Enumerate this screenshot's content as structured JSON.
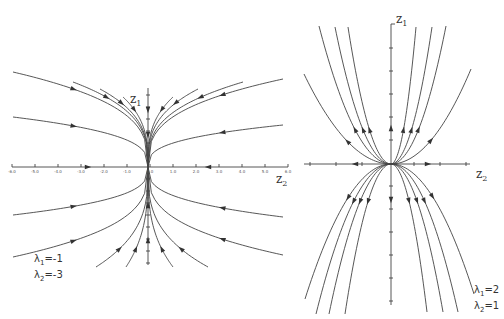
{
  "figure": {
    "panels": [
      {
        "id": "left",
        "type": "stable-node",
        "axes": {
          "horizontal_label": "z",
          "horizontal_sub": "2",
          "vertical_label": "z",
          "vertical_sub": "1",
          "tick_labels": [
            "-6.0",
            "-5.0",
            "-4.0",
            "-3.0",
            "-2.0",
            "-1.0",
            "0.0",
            "1.0",
            "2.0",
            "3.0",
            "4.0",
            "5.0",
            "6.0"
          ]
        },
        "eigenvalues": {
          "l1_symbol": "λ",
          "l1_sub": "1",
          "l1_value": "=-1",
          "l2_symbol": "λ",
          "l2_sub": "2",
          "l2_value": "=-3"
        }
      },
      {
        "id": "right",
        "type": "unstable-node",
        "axes": {
          "horizontal_label": "z",
          "horizontal_sub": "2",
          "vertical_label": "z",
          "vertical_sub": "1"
        },
        "eigenvalues": {
          "l1_symbol": "λ",
          "l1_sub": "1",
          "l1_value": "=2",
          "l2_symbol": "λ",
          "l2_sub": "2",
          "l2_value": "=1"
        }
      }
    ]
  },
  "chart_data": [
    {
      "type": "phase-portrait",
      "title": "",
      "xlabel": "z2",
      "ylabel": "z1",
      "eigenvalues": [
        -1,
        -3
      ],
      "behavior": "stable node, trajectories converge to origin tangent to z1 axis",
      "x_ticks": [
        -6,
        -5,
        -4,
        -3,
        -2,
        -1,
        0,
        1,
        2,
        3,
        4,
        5,
        6
      ],
      "trajectories_above": 8,
      "trajectories_below": 8
    },
    {
      "type": "phase-portrait",
      "title": "",
      "xlabel": "z2",
      "ylabel": "z1",
      "eigenvalues": [
        2,
        1
      ],
      "behavior": "unstable node, trajectories leave origin tangent to z2 axis, parabolic",
      "trajectories_above": 8,
      "trajectories_below": 8
    }
  ]
}
